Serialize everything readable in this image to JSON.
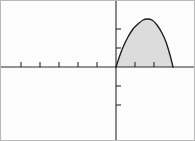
{
  "figure": {
    "title": "",
    "width": 195,
    "height": 141,
    "background_color": "#fcfcfc",
    "frame_color": "#b9b9b9",
    "axis_color": "#2a2a2a",
    "curve_color": "#1a1a1a",
    "shade_color": "#dcdcdc"
  },
  "chart_data": {
    "type": "area",
    "title": "",
    "xlabel": "",
    "ylabel": "",
    "grid": false,
    "legend": null,
    "annotations": [],
    "origin_px": {
      "x": 116,
      "y": 67
    },
    "unit_px": 19,
    "xlim": [
      -6.1,
      4.15
    ],
    "ylim": [
      -3.9,
      3.45
    ],
    "x_tick_values": [
      -5,
      -4,
      -3,
      -2,
      -1,
      1,
      2
    ],
    "y_tick_values": [
      1,
      2,
      -1,
      -2
    ],
    "x_tick_px": [
      21,
      40,
      59,
      78,
      97,
      135,
      154
    ],
    "y_tick_px": [
      48,
      29,
      86,
      105
    ],
    "tick_length_px": 5,
    "roots": [
      0,
      3
    ],
    "vertex": {
      "x": 1.5,
      "y": 2.5
    },
    "curve_px": [
      {
        "x": 116,
        "y": 67
      },
      {
        "x": 120,
        "y": 55
      },
      {
        "x": 124,
        "y": 45
      },
      {
        "x": 128,
        "y": 37
      },
      {
        "x": 133,
        "y": 29
      },
      {
        "x": 138,
        "y": 24
      },
      {
        "x": 143,
        "y": 20
      },
      {
        "x": 147,
        "y": 19
      },
      {
        "x": 152,
        "y": 20
      },
      {
        "x": 157,
        "y": 25
      },
      {
        "x": 162,
        "y": 33
      },
      {
        "x": 166,
        "y": 42
      },
      {
        "x": 170,
        "y": 55
      },
      {
        "x": 173,
        "y": 67
      }
    ],
    "series": [
      {
        "name": "parabola",
        "x": [
          0.0,
          0.25,
          0.5,
          0.75,
          1.0,
          1.25,
          1.5,
          1.75,
          2.0,
          2.25,
          2.5,
          2.75,
          3.0
        ],
        "values": [
          0.0,
          0.63,
          1.17,
          1.62,
          2.0,
          2.29,
          2.5,
          2.29,
          2.0,
          1.62,
          1.17,
          0.63,
          0.0
        ]
      }
    ]
  }
}
